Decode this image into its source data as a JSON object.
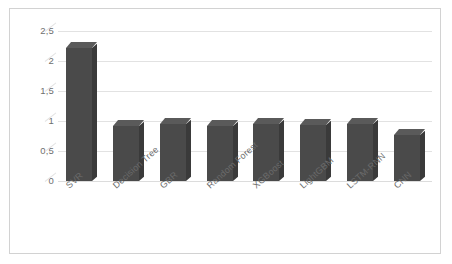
{
  "chart_data": {
    "type": "bar",
    "title": "",
    "subtitle": "",
    "xlabel": "",
    "ylabel": "",
    "categories": [
      "SVR",
      "Decision Tree",
      "GBR",
      "Random Forest",
      "XGBoost",
      "LightGBM",
      "LSTM-RNN",
      "CNN"
    ],
    "values": [
      2.22,
      0.92,
      0.95,
      0.92,
      0.95,
      0.93,
      0.95,
      0.77
    ],
    "ylim": [
      0,
      2.5
    ],
    "y_ticks": [
      0,
      0.5,
      1,
      1.5,
      2,
      2.5
    ],
    "y_tick_labels": [
      "0",
      "0,5",
      "1",
      "1,5",
      "2",
      "2,5"
    ],
    "grid": true,
    "legend": null,
    "legend_position": "none",
    "bar_color": "#4a4a4a",
    "bar_top_color": "#5a5a5a",
    "bar_side_color": "#3a3a3a",
    "gridline_color": "#e2e2e2",
    "frame_color": "#d2d2d2",
    "axis_text_color": "#6b6b6b",
    "style": "3d-column"
  }
}
